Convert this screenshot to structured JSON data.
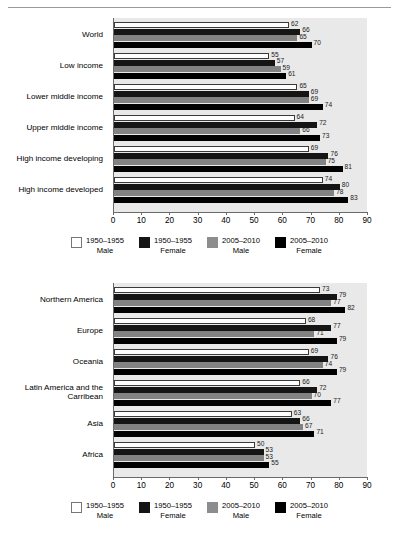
{
  "page": {
    "divider": "horizontal-rule"
  },
  "legend": {
    "items": [
      {
        "swatch": "white",
        "color": "#ffffff",
        "line1": "1950–1955",
        "line2": "Male"
      },
      {
        "swatch": "black",
        "color": "#151515",
        "line1": "1950–1955",
        "line2": "Female"
      },
      {
        "swatch": "gray",
        "color": "#8d8d8d",
        "line1": "2005–2010",
        "line2": "Male"
      },
      {
        "swatch": "black",
        "color": "#000000",
        "line1": "2005–2010",
        "line2": "Female"
      }
    ]
  },
  "axis": {
    "ticks": [
      "0",
      "10",
      "20",
      "30",
      "40",
      "50",
      "60",
      "70",
      "80",
      "90"
    ],
    "min": 0,
    "max": 90
  },
  "chart_data": [
    {
      "type": "bar",
      "orientation": "horizontal",
      "title": "",
      "xlabel": "",
      "ylabel": "",
      "xlim": [
        0,
        90
      ],
      "grid": false,
      "legend_position": "bottom",
      "categories": [
        "World",
        "Low income",
        "Lower middle income",
        "Upper middle income",
        "High income developing",
        "High income developed"
      ],
      "series": [
        {
          "name": "1950–1955 Male",
          "values": [
            62,
            55,
            65,
            64,
            69,
            74
          ]
        },
        {
          "name": "1950–1955 Female",
          "values": [
            66,
            57,
            69,
            72,
            76,
            80
          ]
        },
        {
          "name": "2005–2010 Male",
          "values": [
            65,
            59,
            69,
            66,
            75,
            78
          ]
        },
        {
          "name": "2005–2010 Female",
          "values": [
            70,
            61,
            74,
            73,
            81,
            83
          ]
        }
      ]
    },
    {
      "type": "bar",
      "orientation": "horizontal",
      "title": "",
      "xlabel": "",
      "ylabel": "",
      "xlim": [
        0,
        90
      ],
      "grid": false,
      "legend_position": "bottom",
      "categories": [
        "Northern America",
        "Europe",
        "Oceania",
        "Latin America and the\nCarribean",
        "Asia",
        "Africa"
      ],
      "series": [
        {
          "name": "1950–1955 Male",
          "values": [
            73,
            68,
            69,
            66,
            63,
            50
          ]
        },
        {
          "name": "1950–1955 Female",
          "values": [
            79,
            77,
            76,
            72,
            66,
            53
          ]
        },
        {
          "name": "2005–2010 Male",
          "values": [
            77,
            71,
            74,
            70,
            67,
            53
          ]
        },
        {
          "name": "2005–2010 Female",
          "values": [
            82,
            79,
            79,
            77,
            71,
            55
          ]
        }
      ]
    }
  ]
}
